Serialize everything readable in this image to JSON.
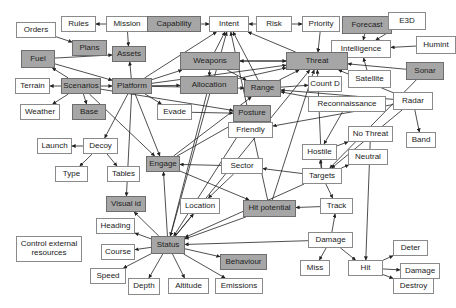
{
  "diagram": {
    "colors": {
      "gray_fill": "#a6a6a6",
      "white_fill": "#ffffff",
      "border": "#8a8a8a",
      "edge": "#222222"
    },
    "nodes": [
      {
        "id": "orders",
        "label": "Orders",
        "x": 16,
        "y": 22,
        "w": 40,
        "h": 16,
        "gray": false
      },
      {
        "id": "rules",
        "label": "Rules",
        "x": 61,
        "y": 16,
        "w": 35,
        "h": 16,
        "gray": false
      },
      {
        "id": "mission",
        "label": "Mission",
        "x": 106,
        "y": 16,
        "w": 42,
        "h": 16,
        "gray": false
      },
      {
        "id": "capability",
        "label": "Capability",
        "x": 147,
        "y": 16,
        "w": 54,
        "h": 16,
        "gray": true
      },
      {
        "id": "intent",
        "label": "Intent",
        "x": 209,
        "y": 16,
        "w": 40,
        "h": 16,
        "gray": false
      },
      {
        "id": "risk",
        "label": "Risk",
        "x": 256,
        "y": 16,
        "w": 36,
        "h": 16,
        "gray": false
      },
      {
        "id": "priority",
        "label": "Priority",
        "x": 302,
        "y": 16,
        "w": 38,
        "h": 16,
        "gray": false
      },
      {
        "id": "forecast",
        "label": "Forecast",
        "x": 342,
        "y": 16,
        "w": 50,
        "h": 18,
        "gray": true
      },
      {
        "id": "e3d",
        "label": "E3D",
        "x": 388,
        "y": 12,
        "w": 38,
        "h": 18,
        "gray": false
      },
      {
        "id": "plans",
        "label": "Plans",
        "x": 72,
        "y": 40,
        "w": 35,
        "h": 16,
        "gray": true
      },
      {
        "id": "assets",
        "label": "Assets",
        "x": 112,
        "y": 46,
        "w": 34,
        "h": 16,
        "gray": true
      },
      {
        "id": "intelligence",
        "label": "Intelligence",
        "x": 331,
        "y": 40,
        "w": 60,
        "h": 18,
        "gray": false
      },
      {
        "id": "humint",
        "label": "Humint",
        "x": 416,
        "y": 36,
        "w": 40,
        "h": 18,
        "gray": false
      },
      {
        "id": "fuel",
        "label": "Fuel",
        "x": 21,
        "y": 50,
        "w": 34,
        "h": 18,
        "gray": true
      },
      {
        "id": "weapons",
        "label": "Weapons",
        "x": 180,
        "y": 52,
        "w": 60,
        "h": 18,
        "gray": true
      },
      {
        "id": "threat",
        "label": "Threat",
        "x": 286,
        "y": 52,
        "w": 62,
        "h": 18,
        "gray": true
      },
      {
        "id": "terrain",
        "label": "Terrain",
        "x": 15,
        "y": 78,
        "w": 35,
        "h": 16,
        "gray": false
      },
      {
        "id": "scenarios",
        "label": "Scenarios",
        "x": 61,
        "y": 78,
        "w": 40,
        "h": 16,
        "gray": true
      },
      {
        "id": "platform",
        "label": "Platform",
        "x": 112,
        "y": 78,
        "w": 40,
        "h": 16,
        "gray": true
      },
      {
        "id": "allocation",
        "label": "Allocation",
        "x": 180,
        "y": 76,
        "w": 58,
        "h": 18,
        "gray": true
      },
      {
        "id": "range",
        "label": "Range",
        "x": 244,
        "y": 80,
        "w": 37,
        "h": 17,
        "gray": true
      },
      {
        "id": "count_d",
        "label": "Count D",
        "x": 308,
        "y": 76,
        "w": 34,
        "h": 16,
        "gray": false
      },
      {
        "id": "satellite",
        "label": "Satellite",
        "x": 348,
        "y": 70,
        "w": 43,
        "h": 18,
        "gray": false
      },
      {
        "id": "sonar",
        "label": "Sonar",
        "x": 406,
        "y": 62,
        "w": 38,
        "h": 18,
        "gray": true
      },
      {
        "id": "weather",
        "label": "Weather",
        "x": 20,
        "y": 104,
        "w": 40,
        "h": 16,
        "gray": false
      },
      {
        "id": "base",
        "label": "Base",
        "x": 72,
        "y": 104,
        "w": 34,
        "h": 16,
        "gray": true
      },
      {
        "id": "evade",
        "label": "Evade",
        "x": 157,
        "y": 104,
        "w": 35,
        "h": 16,
        "gray": false
      },
      {
        "id": "posture",
        "label": "Posture",
        "x": 233,
        "y": 105,
        "w": 38,
        "h": 17,
        "gray": true
      },
      {
        "id": "reconnaissance",
        "label": "Reconnaissance",
        "x": 308,
        "y": 96,
        "w": 78,
        "h": 16,
        "gray": false
      },
      {
        "id": "radar",
        "label": "Radar",
        "x": 393,
        "y": 92,
        "w": 40,
        "h": 18,
        "gray": false
      },
      {
        "id": "friendly",
        "label": "Friendly",
        "x": 228,
        "y": 122,
        "w": 45,
        "h": 16,
        "gray": false
      },
      {
        "id": "no_threat",
        "label": "No Threat",
        "x": 348,
        "y": 126,
        "w": 45,
        "h": 16,
        "gray": false
      },
      {
        "id": "band",
        "label": "Band",
        "x": 406,
        "y": 132,
        "w": 30,
        "h": 16,
        "gray": false
      },
      {
        "id": "launch",
        "label": "Launch",
        "x": 37,
        "y": 138,
        "w": 35,
        "h": 16,
        "gray": false
      },
      {
        "id": "decoy",
        "label": "Decoy",
        "x": 83,
        "y": 138,
        "w": 35,
        "h": 16,
        "gray": false
      },
      {
        "id": "hostile",
        "label": "Hostile",
        "x": 302,
        "y": 144,
        "w": 35,
        "h": 16,
        "gray": false
      },
      {
        "id": "engage",
        "label": "Engage",
        "x": 146,
        "y": 156,
        "w": 34,
        "h": 16,
        "gray": true
      },
      {
        "id": "sector",
        "label": "Sector",
        "x": 221,
        "y": 158,
        "w": 42,
        "h": 16,
        "gray": false
      },
      {
        "id": "neutral",
        "label": "Neutral",
        "x": 348,
        "y": 149,
        "w": 40,
        "h": 16,
        "gray": false
      },
      {
        "id": "type",
        "label": "Type",
        "x": 55,
        "y": 166,
        "w": 33,
        "h": 16,
        "gray": false
      },
      {
        "id": "tables",
        "label": "Tables",
        "x": 107,
        "y": 166,
        "w": 33,
        "h": 16,
        "gray": false
      },
      {
        "id": "targets",
        "label": "Targets",
        "x": 302,
        "y": 168,
        "w": 40,
        "h": 16,
        "gray": false
      },
      {
        "id": "visual_id",
        "label": "Visual id",
        "x": 106,
        "y": 196,
        "w": 40,
        "h": 16,
        "gray": true
      },
      {
        "id": "location",
        "label": "Location",
        "x": 180,
        "y": 198,
        "w": 40,
        "h": 16,
        "gray": false
      },
      {
        "id": "hit_potential",
        "label": "Hit potential",
        "x": 243,
        "y": 200,
        "w": 53,
        "h": 17,
        "gray": true
      },
      {
        "id": "track",
        "label": "Track",
        "x": 320,
        "y": 198,
        "w": 33,
        "h": 16,
        "gray": false
      },
      {
        "id": "heading",
        "label": "Heading",
        "x": 96,
        "y": 218,
        "w": 39,
        "h": 16,
        "gray": false
      },
      {
        "id": "control",
        "label": "Control external resources",
        "x": 16,
        "y": 236,
        "w": 66,
        "h": 26,
        "gray": false,
        "wrap": true
      },
      {
        "id": "course",
        "label": "Course",
        "x": 101,
        "y": 244,
        "w": 34,
        "h": 16,
        "gray": false
      },
      {
        "id": "status",
        "label": "Status",
        "x": 151,
        "y": 236,
        "w": 34,
        "h": 18,
        "gray": true
      },
      {
        "id": "damage",
        "label": "Damage",
        "x": 308,
        "y": 232,
        "w": 45,
        "h": 16,
        "gray": false
      },
      {
        "id": "behaviour",
        "label": "Behaviour",
        "x": 220,
        "y": 254,
        "w": 47,
        "h": 16,
        "gray": true
      },
      {
        "id": "deter",
        "label": "Deter",
        "x": 393,
        "y": 240,
        "w": 35,
        "h": 16,
        "gray": false
      },
      {
        "id": "speed",
        "label": "Speed",
        "x": 90,
        "y": 268,
        "w": 36,
        "h": 16,
        "gray": false
      },
      {
        "id": "damage2",
        "label": "Damage",
        "x": 400,
        "y": 263,
        "w": 40,
        "h": 16,
        "gray": false
      },
      {
        "id": "miss",
        "label": "Miss",
        "x": 300,
        "y": 260,
        "w": 30,
        "h": 16,
        "gray": false
      },
      {
        "id": "hit",
        "label": "Hit",
        "x": 348,
        "y": 260,
        "w": 35,
        "h": 16,
        "gray": false
      },
      {
        "id": "depth",
        "label": "Depth",
        "x": 128,
        "y": 278,
        "w": 32,
        "h": 17,
        "gray": false
      },
      {
        "id": "altitude",
        "label": "Altitude",
        "x": 168,
        "y": 278,
        "w": 41,
        "h": 16,
        "gray": false
      },
      {
        "id": "emissions",
        "label": "Emissions",
        "x": 215,
        "y": 278,
        "w": 48,
        "h": 16,
        "gray": false
      },
      {
        "id": "destroy",
        "label": "Destroy",
        "x": 393,
        "y": 278,
        "w": 41,
        "h": 16,
        "gray": false
      }
    ],
    "edges": [
      [
        "mission",
        "rules"
      ],
      [
        "orders",
        "plans"
      ],
      [
        "mission",
        "assets"
      ],
      [
        "capability",
        "intent"
      ],
      [
        "risk",
        "intent"
      ],
      [
        "risk",
        "priority"
      ],
      [
        "forecast",
        "intelligence"
      ],
      [
        "e3d",
        "intelligence"
      ],
      [
        "humint",
        "intelligence"
      ],
      [
        "satellite",
        "intelligence"
      ],
      [
        "fuel",
        "assets"
      ],
      [
        "fuel",
        "platform"
      ],
      [
        "scenarios",
        "fuel"
      ],
      [
        "scenarios",
        "terrain"
      ],
      [
        "scenarios",
        "platform"
      ],
      [
        "scenarios",
        "weather"
      ],
      [
        "scenarios",
        "base"
      ],
      [
        "scenarios",
        "engage"
      ],
      [
        "scenarios",
        "posture"
      ],
      [
        "platform",
        "assets"
      ],
      [
        "platform",
        "intent"
      ],
      [
        "platform",
        "weapons"
      ],
      [
        "platform",
        "allocation"
      ],
      [
        "platform",
        "range"
      ],
      [
        "platform",
        "threat"
      ],
      [
        "platform",
        "evade"
      ],
      [
        "platform",
        "decoy"
      ],
      [
        "platform",
        "engage"
      ],
      [
        "platform",
        "visual_id"
      ],
      [
        "decoy",
        "launch"
      ],
      [
        "decoy",
        "type"
      ],
      [
        "decoy",
        "tables"
      ],
      [
        "weapons",
        "intent"
      ],
      [
        "weapons",
        "threat"
      ],
      [
        "weapons",
        "allocation"
      ],
      [
        "weapons",
        "range"
      ],
      [
        "threat",
        "weapons"
      ],
      [
        "priority",
        "threat"
      ],
      [
        "intelligence",
        "threat"
      ],
      [
        "sonar",
        "threat"
      ],
      [
        "radar",
        "threat"
      ],
      [
        "threat",
        "intent"
      ],
      [
        "allocation",
        "threat"
      ],
      [
        "allocation",
        "status"
      ],
      [
        "range",
        "intent"
      ],
      [
        "range",
        "count_d"
      ],
      [
        "range",
        "threat"
      ],
      [
        "radar",
        "range"
      ],
      [
        "reconnaissance",
        "range"
      ],
      [
        "evade",
        "posture"
      ],
      [
        "engage",
        "posture"
      ],
      [
        "engage",
        "range"
      ],
      [
        "engage",
        "hit_potential"
      ],
      [
        "sector",
        "engage"
      ],
      [
        "posture",
        "status"
      ],
      [
        "radar",
        "band"
      ],
      [
        "radar",
        "targets"
      ],
      [
        "radar",
        "friendly"
      ],
      [
        "sonar",
        "targets"
      ],
      [
        "reconnaissance",
        "hostile"
      ],
      [
        "hostile",
        "no_threat"
      ],
      [
        "targets",
        "hostile"
      ],
      [
        "targets",
        "neutral"
      ],
      [
        "targets",
        "track"
      ],
      [
        "targets",
        "status"
      ],
      [
        "targets",
        "threat"
      ],
      [
        "targets",
        "sector"
      ],
      [
        "no_threat",
        "hit"
      ],
      [
        "sector",
        "location"
      ],
      [
        "hit_potential",
        "status"
      ],
      [
        "hit_potential",
        "threat"
      ],
      [
        "hit_potential",
        "intent"
      ],
      [
        "track",
        "hit_potential"
      ],
      [
        "damage",
        "track"
      ],
      [
        "damage",
        "status"
      ],
      [
        "damage",
        "miss"
      ],
      [
        "damage",
        "hit"
      ],
      [
        "hit",
        "deter"
      ],
      [
        "hit",
        "damage2"
      ],
      [
        "hit",
        "destroy"
      ],
      [
        "status",
        "visual_id"
      ],
      [
        "status",
        "heading"
      ],
      [
        "status",
        "course"
      ],
      [
        "status",
        "speed"
      ],
      [
        "status",
        "depth"
      ],
      [
        "status",
        "altitude"
      ],
      [
        "status",
        "emissions"
      ],
      [
        "status",
        "behaviour"
      ],
      [
        "status",
        "location"
      ],
      [
        "status",
        "threat"
      ],
      [
        "status",
        "engage"
      ],
      [
        "status",
        "intent"
      ]
    ]
  }
}
